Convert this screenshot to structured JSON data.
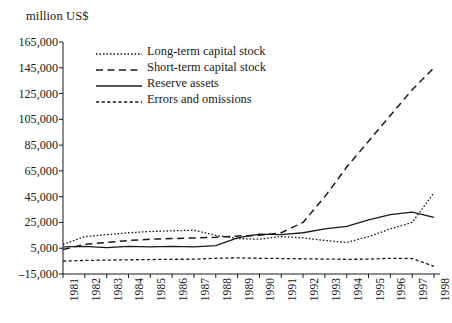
{
  "chart_data": {
    "type": "line",
    "title": "",
    "subtitle": "",
    "ylabel": "million US$",
    "xlabel": "",
    "ylim": [
      -15000,
      165000
    ],
    "ytick_step": 20000,
    "yticks": [
      165000,
      145000,
      125000,
      105000,
      85000,
      65000,
      45000,
      25000,
      5000,
      -15000
    ],
    "ytick_labels": [
      "165,000",
      "145,000",
      "125,000",
      "105,000",
      "85,000",
      "65,000",
      "45,000",
      "25,000",
      "5,000",
      "–15,000"
    ],
    "x": [
      1981,
      1982,
      1983,
      1984,
      1985,
      1986,
      1987,
      1988,
      1989,
      1990,
      1991,
      1992,
      1993,
      1994,
      1995,
      1996,
      1997,
      1998
    ],
    "xtick_labels": [
      "1981",
      "1982",
      "1983",
      "1984",
      "1985",
      "1986",
      "1987",
      "1988",
      "1989",
      "1990",
      "1991",
      "1992",
      "1993",
      "1994",
      "1995",
      "1996",
      "1997",
      "1998"
    ],
    "grid": false,
    "legend_position": "top-left-inside",
    "series": [
      {
        "name": "Long-term capital stock",
        "style": "dotted",
        "color": "#1a1a1a",
        "values": [
          8000,
          14000,
          15500,
          17000,
          18000,
          18500,
          19000,
          15000,
          12500,
          12000,
          14000,
          13000,
          11000,
          9500,
          14000,
          20000,
          25000,
          48000
        ]
      },
      {
        "name": "Short-term capital stock",
        "style": "dashed",
        "color": "#1a1a1a",
        "values": [
          4000,
          8000,
          9500,
          11000,
          12000,
          12500,
          13000,
          13500,
          14500,
          15000,
          17000,
          25000,
          45000,
          68000,
          88000,
          108000,
          128000,
          145000
        ]
      },
      {
        "name": "Reserve assets",
        "style": "solid",
        "color": "#1a1a1a",
        "values": [
          6000,
          6500,
          5500,
          6500,
          6000,
          6500,
          6000,
          7000,
          13000,
          16000,
          15500,
          17000,
          20000,
          22000,
          27000,
          31000,
          33000,
          29000
        ]
      },
      {
        "name": "Errors and omissions",
        "style": "dashed-fine",
        "color": "#1a1a1a",
        "values": [
          -5000,
          -4500,
          -4200,
          -4000,
          -3800,
          -3600,
          -3500,
          -2800,
          -2500,
          -2800,
          -3000,
          -3200,
          -3400,
          -3600,
          -3500,
          -2800,
          -3000,
          -9000
        ]
      }
    ]
  },
  "legend": {
    "items": [
      {
        "label": "Long-term capital stock",
        "style": "dotted"
      },
      {
        "label": "Short-term capital stock",
        "style": "dashed"
      },
      {
        "label": "Reserve assets",
        "style": "solid"
      },
      {
        "label": "Errors and omissions",
        "style": "dashed-fine"
      }
    ]
  }
}
